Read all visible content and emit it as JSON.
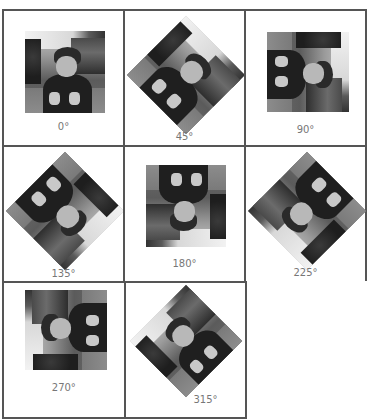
{
  "grid": {
    "columns": 3,
    "cells": [
      {
        "label": "0°",
        "rotation": 0
      },
      {
        "label": "45°",
        "rotation": 45
      },
      {
        "label": "90°",
        "rotation": 90
      },
      {
        "label": "135°",
        "rotation": 135
      },
      {
        "label": "180°",
        "rotation": 180
      },
      {
        "label": "225°",
        "rotation": 225
      },
      {
        "label": "270°",
        "rotation": 270
      },
      {
        "label": "315°",
        "rotation": 315
      }
    ]
  },
  "colors": {
    "border": "#555555",
    "label": "#777777",
    "background": "#ffffff"
  }
}
